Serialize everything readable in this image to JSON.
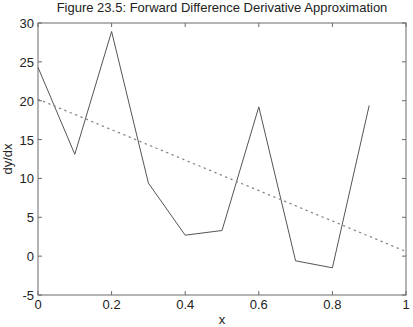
{
  "chart_data": {
    "type": "line",
    "title": "Figure 23.5: Forward Difference Derivative Approximation",
    "xlabel": "x",
    "ylabel": "dy/dx",
    "xlim": [
      0,
      1
    ],
    "ylim": [
      -5,
      30
    ],
    "xticks": [
      0,
      0.2,
      0.4,
      0.6,
      0.8,
      1
    ],
    "xtick_labels": [
      "0",
      "0.2",
      "0.4",
      "0.6",
      "0.8",
      "1"
    ],
    "yticks": [
      -5,
      0,
      5,
      10,
      15,
      20,
      25,
      30
    ],
    "ytick_labels": [
      "-5",
      "0",
      "5",
      "10",
      "15",
      "20",
      "25",
      "30"
    ],
    "grid": false,
    "legend": null,
    "series": [
      {
        "name": "forward difference approximation",
        "style": "solid",
        "color": "#555555",
        "x": [
          0,
          0.1,
          0.2,
          0.3,
          0.4,
          0.5,
          0.6,
          0.7,
          0.8,
          0.9
        ],
        "values": [
          24.3,
          13.1,
          28.9,
          9.4,
          2.7,
          3.3,
          19.2,
          -0.6,
          -1.5,
          19.4
        ]
      },
      {
        "name": "exact derivative",
        "style": "dotted",
        "color": "#888888",
        "x": [
          0,
          1
        ],
        "values": [
          20.2,
          0.6
        ]
      }
    ]
  }
}
